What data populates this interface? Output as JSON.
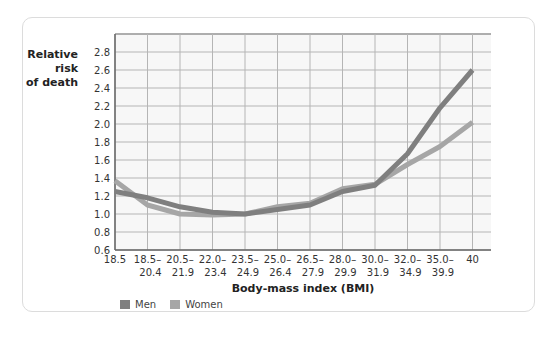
{
  "chart_data": {
    "type": "line",
    "title": "",
    "xlabel": "Body-mass index (BMI)",
    "ylabel": "Relative risk of death",
    "ylabel_lines": [
      "Relative risk",
      "of death"
    ],
    "categories": [
      "18.5",
      "18.5–20.4",
      "20.5–21.9",
      "22.0–23.4",
      "23.5–24.9",
      "25.0–26.4",
      "26.5–27.9",
      "28.0–29.9",
      "30.0–31.9",
      "32.0–34.9",
      "35.0–39.9",
      "40"
    ],
    "category_lines": [
      [
        "18.5",
        ""
      ],
      [
        "18.5–",
        "20.4"
      ],
      [
        "20.5–",
        "21.9"
      ],
      [
        "22.0–",
        "23.4"
      ],
      [
        "23.5–",
        "24.9"
      ],
      [
        "25.0–",
        "26.4"
      ],
      [
        "26.5–",
        "27.9"
      ],
      [
        "28.0–",
        "29.9"
      ],
      [
        "30.0–",
        "31.9"
      ],
      [
        "32.0–",
        "34.9"
      ],
      [
        "35.0–",
        "39.9"
      ],
      [
        "40",
        ""
      ]
    ],
    "yticks": [
      "0.6",
      "0.8",
      "1.0",
      "1.2",
      "1.4",
      "1.6",
      "1.8",
      "2.0",
      "2.2",
      "2.4",
      "2.6",
      "2.8"
    ],
    "ylim": [
      0.6,
      2.9
    ],
    "grid": true,
    "legend_position": "bottom-left",
    "series": [
      {
        "name": "Men",
        "color": "#7f7f7f",
        "values": [
          1.25,
          1.18,
          1.08,
          1.02,
          1.0,
          1.05,
          1.1,
          1.25,
          1.32,
          1.67,
          2.18,
          2.6
        ]
      },
      {
        "name": "Women",
        "color": "#a6a6a6",
        "values": [
          1.37,
          1.1,
          1.0,
          0.99,
          1.0,
          1.08,
          1.12,
          1.28,
          1.33,
          1.55,
          1.75,
          2.02
        ]
      }
    ]
  },
  "legend": [
    {
      "label": "Men",
      "color": "#7f7f7f"
    },
    {
      "label": "Women",
      "color": "#a6a6a6"
    }
  ]
}
